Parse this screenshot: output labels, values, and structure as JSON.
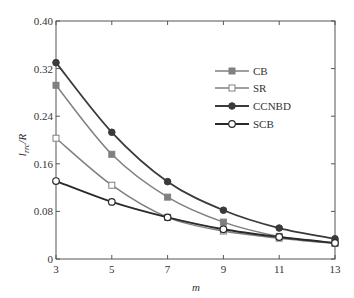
{
  "chart_data": {
    "type": "line",
    "title": "",
    "xlabel": "m",
    "ylabel": "l_rrc/R",
    "ylabel_main": "l",
    "ylabel_sub": "rrc",
    "ylabel_tail": "/R",
    "x": [
      3,
      5,
      7,
      9,
      11,
      13
    ],
    "xlim": [
      3,
      13
    ],
    "ylim": [
      0,
      0.4
    ],
    "xticks": [
      "3",
      "5",
      "7",
      "9",
      "11",
      "13"
    ],
    "yticks": [
      "0",
      "0.08",
      "0.16",
      "0.24",
      "0.32",
      "0.40"
    ],
    "grid": false,
    "legend_position": "upper right",
    "series": [
      {
        "name": "CB",
        "marker": "filled-square",
        "color": "#808080",
        "values": [
          0.292,
          0.176,
          0.104,
          0.062,
          0.038,
          0.027
        ]
      },
      {
        "name": "SR",
        "marker": "open-square",
        "color": "#808080",
        "values": [
          0.203,
          0.124,
          0.07,
          0.047,
          0.035,
          0.026
        ]
      },
      {
        "name": "CCNBD",
        "marker": "filled-circle",
        "color": "#3a3a3a",
        "values": [
          0.33,
          0.213,
          0.13,
          0.082,
          0.052,
          0.034
        ]
      },
      {
        "name": "SCB",
        "marker": "open-circle",
        "color": "#2a2a2a",
        "values": [
          0.131,
          0.096,
          0.07,
          0.05,
          0.037,
          0.027
        ]
      }
    ]
  }
}
